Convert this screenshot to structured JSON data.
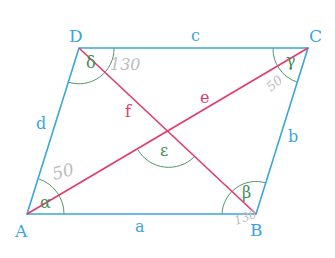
{
  "diagram": {
    "type": "parallelogram",
    "colors": {
      "sides": "#3aa6dd",
      "diagonals": "#e23a6a",
      "angles": "#3f8f55",
      "annotations": "#b8b8b8"
    },
    "vertices": {
      "A": {
        "label": "A",
        "x": 27,
        "y": 214
      },
      "B": {
        "label": "B",
        "x": 256,
        "y": 214
      },
      "C": {
        "label": "C",
        "x": 308,
        "y": 48
      },
      "D": {
        "label": "D",
        "x": 79,
        "y": 48
      }
    },
    "sides": {
      "a": "a",
      "b": "b",
      "c": "c",
      "d": "d"
    },
    "diagonals": {
      "e": "e",
      "f": "f"
    },
    "angles": {
      "alpha": "α",
      "beta": "β",
      "gamma": "γ",
      "delta": "δ",
      "epsilon": "ε"
    },
    "handwritten_values": {
      "alpha": "50",
      "delta": "130",
      "gamma": "50",
      "beta": "130"
    }
  }
}
